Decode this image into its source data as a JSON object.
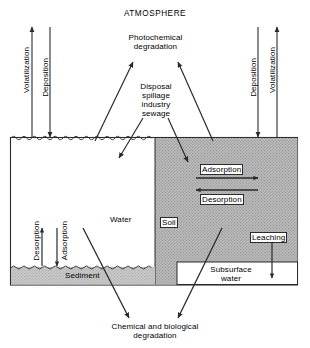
{
  "diagram": {
    "title": "ATMOSPHERE",
    "domain_type": "environmental fate schematic",
    "colors": {
      "line": "#2b2b2b",
      "soil_fill": "#b8b8b8",
      "sediment_fill": "#c6c6c6",
      "water_fill": "#ffffff",
      "background": "#ffffff",
      "text": "#000000"
    },
    "compartments": [
      {
        "id": "water",
        "label": "Water"
      },
      {
        "id": "soil",
        "label": "Soil"
      },
      {
        "id": "sediment",
        "label": "Sediment"
      },
      {
        "id": "subsurface-water",
        "label": "Subsurface\nwater",
        "line1": "Subsurface",
        "line2": "water"
      }
    ],
    "processes": {
      "volatilization_left": "Volatilization",
      "deposition_left": "Deposition",
      "deposition_right": "Deposition",
      "volatilization_right": "Volatilization",
      "photochemical": {
        "line1": "Photochemical",
        "line2": "degradation"
      },
      "source": {
        "line1": "Disposal",
        "line2": "spillage",
        "line3": "industry",
        "line4": "sewage"
      },
      "adsorption_soil": "Adsorption",
      "desorption_soil": "Desorption",
      "desorption_sediment": "Desorption",
      "adsorption_sediment": "Adsorption",
      "leaching": "Leaching",
      "degradation": {
        "line1": "Chemical and biological",
        "line2": "degradation"
      }
    }
  }
}
